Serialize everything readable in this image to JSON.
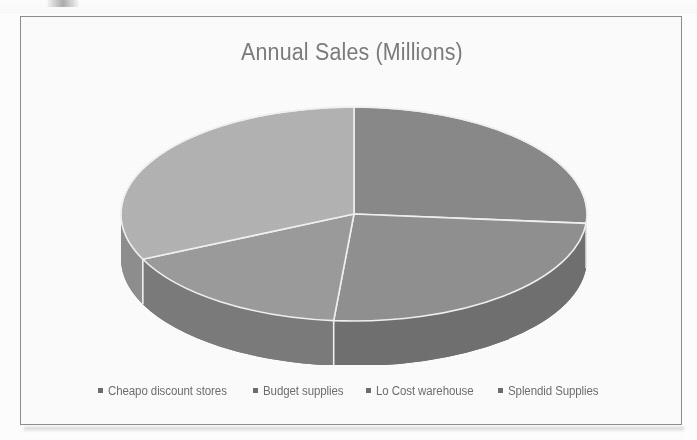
{
  "chart_data": {
    "type": "pie",
    "title": "Annual Sales (Millions)",
    "style": "3d-pie",
    "categories": [
      "Cheapo discount stores",
      "Budget supplies",
      "Lo Cost warehouse",
      "Splendid Supplies"
    ],
    "values": [
      26,
      25,
      17,
      32
    ],
    "percentages": [
      26,
      25,
      17,
      32
    ],
    "start_angle_deg": 0,
    "slice_boundaries_deg": [
      0,
      95,
      185,
      245,
      360
    ],
    "colors": [
      "#8a8a8a",
      "#919191",
      "#9c9c9c",
      "#b4b4b4"
    ],
    "side_colors": [
      "#6a6a6a",
      "#717171",
      "#7b7b7b",
      "#8f8f8f"
    ],
    "slice_separator_color": "#f2f2f2",
    "legend_position": "bottom",
    "legend_marker": "square",
    "grid": false,
    "xlabel": "",
    "ylabel": "",
    "data_labels": false
  },
  "frame": {
    "border_color": "#8e8e8e",
    "background": "#fdfdfd"
  },
  "title": {
    "text": "Annual Sales (Millions)",
    "color": "#7c7c7c"
  },
  "legend": {
    "items": [
      {
        "label": "Cheapo discount stores",
        "color": "#8a8a8a"
      },
      {
        "label": "Budget supplies",
        "color": "#919191"
      },
      {
        "label": "Lo Cost warehouse",
        "color": "#9c9c9c"
      },
      {
        "label": "Splendid Supplies",
        "color": "#b4b4b4"
      }
    ]
  }
}
